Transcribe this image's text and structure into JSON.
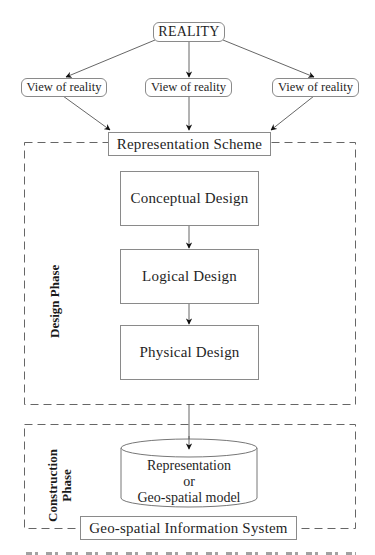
{
  "diagram": {
    "top": {
      "reality": "REALITY",
      "views": [
        "View of reality",
        "View of reality",
        "View of reality"
      ],
      "representation_scheme": "Representation Scheme"
    },
    "design_phase": {
      "label": "Design Phase",
      "steps": [
        "Conceptual Design",
        "Logical Design",
        "Physical Design"
      ]
    },
    "construction_phase": {
      "label_line1": "Construction",
      "label_line2": "Phase",
      "model_lines": [
        "Representation",
        "or",
        "Geo-spatial model"
      ],
      "system": "Geo-spatial Information System"
    },
    "colors": {
      "line": "#555555",
      "box_border": "#8a8a8a",
      "dash": "#666666",
      "text": "#1f1f1f"
    }
  }
}
